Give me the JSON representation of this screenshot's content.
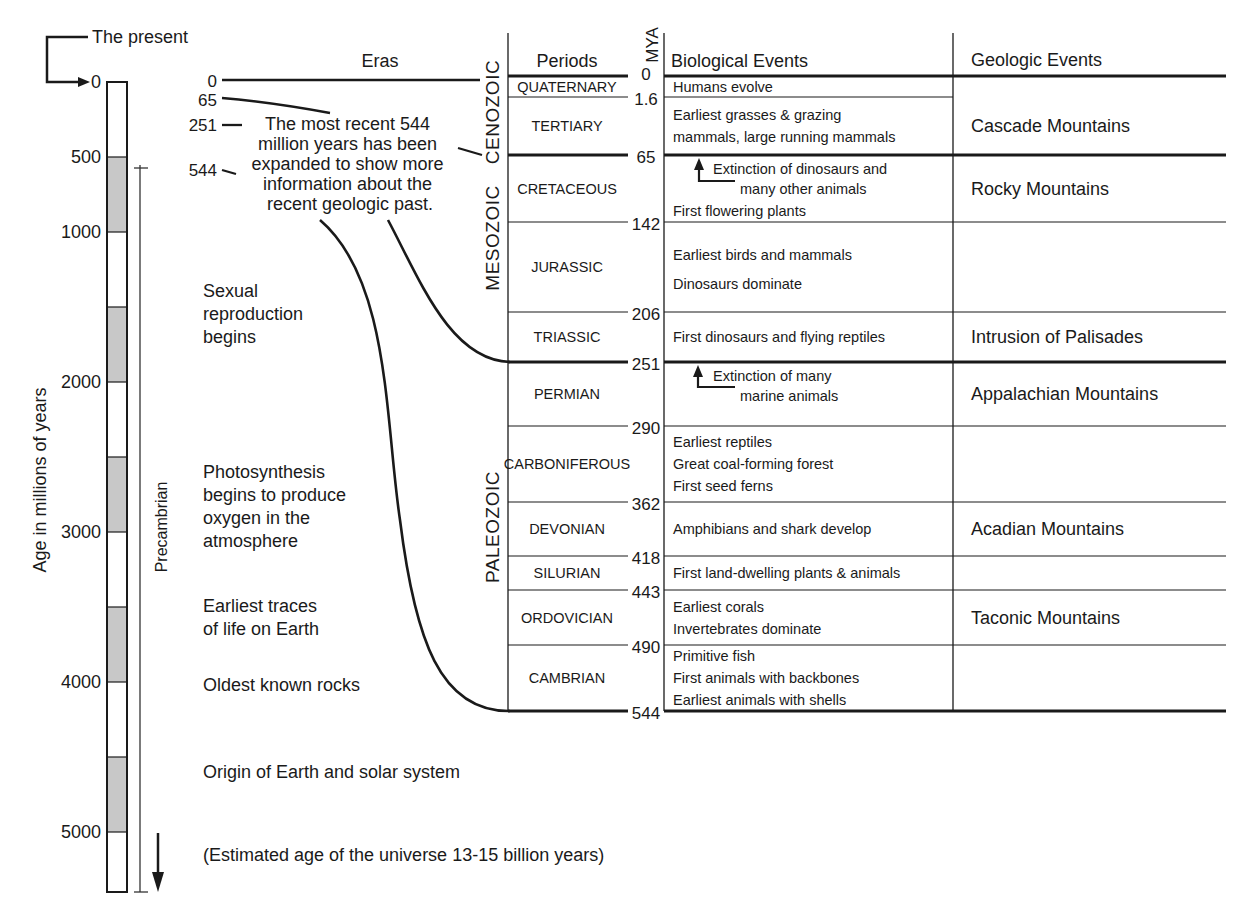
{
  "left_scale": {
    "present_label": "The present",
    "axis_label": "Age in millions of years",
    "ticks": [
      {
        "value": 0,
        "label": "0"
      },
      {
        "value": 500,
        "label": "500"
      },
      {
        "value": 1000,
        "label": "1000"
      },
      {
        "value": 2000,
        "label": "2000"
      },
      {
        "value": 3000,
        "label": "3000"
      },
      {
        "value": 4000,
        "label": "4000"
      },
      {
        "value": 5000,
        "label": "5000"
      }
    ],
    "shaded_bands_mya": [
      [
        500,
        1000
      ],
      [
        1500,
        2000
      ],
      [
        2500,
        3000
      ],
      [
        3500,
        4000
      ],
      [
        4500,
        5000
      ]
    ],
    "scale_max_mya": 5400,
    "precambrian_label": "Precambrian",
    "precambrian_range_mya": [
      544,
      5400
    ],
    "events": [
      {
        "id": "sexual",
        "lines": [
          "Sexual",
          "reproduction",
          "begins"
        ]
      },
      {
        "id": "photo",
        "lines": [
          "Photosynthesis",
          "begins to produce",
          "oxygen in the",
          "atmosphere"
        ]
      },
      {
        "id": "life",
        "lines": [
          "Earliest traces",
          "of life on Earth"
        ]
      },
      {
        "id": "rocks",
        "lines": [
          "Oldest known rocks"
        ]
      },
      {
        "id": "origin",
        "lines": [
          "Origin of Earth and solar system"
        ]
      },
      {
        "id": "universe",
        "lines": [
          "(Estimated age of the universe 13-15 billion years)"
        ]
      }
    ]
  },
  "expansion": {
    "eras_header": "Eras",
    "marker_labels": [
      "0",
      "65",
      "251",
      "544"
    ],
    "note_lines": [
      "The most recent 544",
      "million years has been",
      "expanded to show more",
      "information about the",
      "recent geologic past."
    ]
  },
  "table": {
    "headers": {
      "periods": "Periods",
      "mya": "MYA",
      "bio": "Biological Events",
      "geo": "Geologic Events"
    },
    "eras": [
      {
        "name": "CENOZOIC",
        "from": 0,
        "to": 65
      },
      {
        "name": "MESOZOIC",
        "from": 65,
        "to": 251
      },
      {
        "name": "PALEOZOIC",
        "from": 251,
        "to": 544
      }
    ],
    "boundaries": [
      {
        "mya": 0,
        "label": "0",
        "major": true
      },
      {
        "mya": 1.6,
        "label": "1.6",
        "major": false
      },
      {
        "mya": 65,
        "label": "65",
        "major": true
      },
      {
        "mya": 142,
        "label": "142",
        "major": false
      },
      {
        "mya": 206,
        "label": "206",
        "major": false
      },
      {
        "mya": 251,
        "label": "251",
        "major": true
      },
      {
        "mya": 290,
        "label": "290",
        "major": false
      },
      {
        "mya": 362,
        "label": "362",
        "major": false
      },
      {
        "mya": 418,
        "label": "418",
        "major": false
      },
      {
        "mya": 443,
        "label": "443",
        "major": false
      },
      {
        "mya": 490,
        "label": "490",
        "major": false
      },
      {
        "mya": 544,
        "label": "544",
        "major": true
      }
    ],
    "periods": [
      {
        "name": "QUATERNARY",
        "from": 0,
        "to": 1.6,
        "bio": [
          "Humans evolve"
        ]
      },
      {
        "name": "TERTIARY",
        "from": 1.6,
        "to": 65,
        "bio": [
          "Earliest grasses & grazing",
          "mammals, large running mammals"
        ]
      },
      {
        "name": "CRETACEOUS",
        "from": 65,
        "to": 142,
        "bio": [
          "Extinction of dinosaurs and",
          "many other animals",
          "First flowering plants"
        ]
      },
      {
        "name": "JURASSIC",
        "from": 142,
        "to": 206,
        "bio": [
          "Earliest birds and mammals",
          "Dinosaurs dominate"
        ]
      },
      {
        "name": "TRIASSIC",
        "from": 206,
        "to": 251,
        "bio": [
          "First dinosaurs and flying reptiles"
        ]
      },
      {
        "name": "PERMIAN",
        "from": 251,
        "to": 290,
        "bio": [
          "Extinction of many",
          "marine animals"
        ]
      },
      {
        "name": "CARBONIFEROUS",
        "from": 290,
        "to": 362,
        "bio": [
          "Earliest reptiles",
          "Great coal-forming forest",
          "First seed ferns"
        ]
      },
      {
        "name": "DEVONIAN",
        "from": 362,
        "to": 418,
        "bio": [
          "Amphibians and shark develop"
        ]
      },
      {
        "name": "SILURIAN",
        "from": 418,
        "to": 443,
        "bio": [
          "First land-dwelling plants & animals"
        ]
      },
      {
        "name": "ORDOVICIAN",
        "from": 443,
        "to": 490,
        "bio": [
          "Earliest corals",
          "Invertebrates dominate"
        ]
      },
      {
        "name": "CAMBRIAN",
        "from": 490,
        "to": 544,
        "bio": [
          "Primitive fish",
          "First animals with backbones",
          "Earliest animals with shells"
        ]
      }
    ],
    "geologic_events": [
      {
        "text": "Cascade Mountains",
        "from": 0,
        "to": 65
      },
      {
        "text": "Rocky Mountains",
        "from": 65,
        "to": 142
      },
      {
        "text": "",
        "from": 142,
        "to": 206
      },
      {
        "text": "Intrusion of Palisades",
        "from": 206,
        "to": 251
      },
      {
        "text": "Appalachian Mountains",
        "from": 251,
        "to": 290
      },
      {
        "text": "",
        "from": 290,
        "to": 362
      },
      {
        "text": "Acadian Mountains",
        "from": 362,
        "to": 418
      },
      {
        "text": "",
        "from": 418,
        "to": 443
      },
      {
        "text": "Taconic Mountains",
        "from": 443,
        "to": 490
      },
      {
        "text": "",
        "from": 490,
        "to": 544
      }
    ]
  },
  "colors": {
    "ink": "#1a1a1a",
    "band_fill": "#c8c8c8",
    "background": "#ffffff"
  }
}
